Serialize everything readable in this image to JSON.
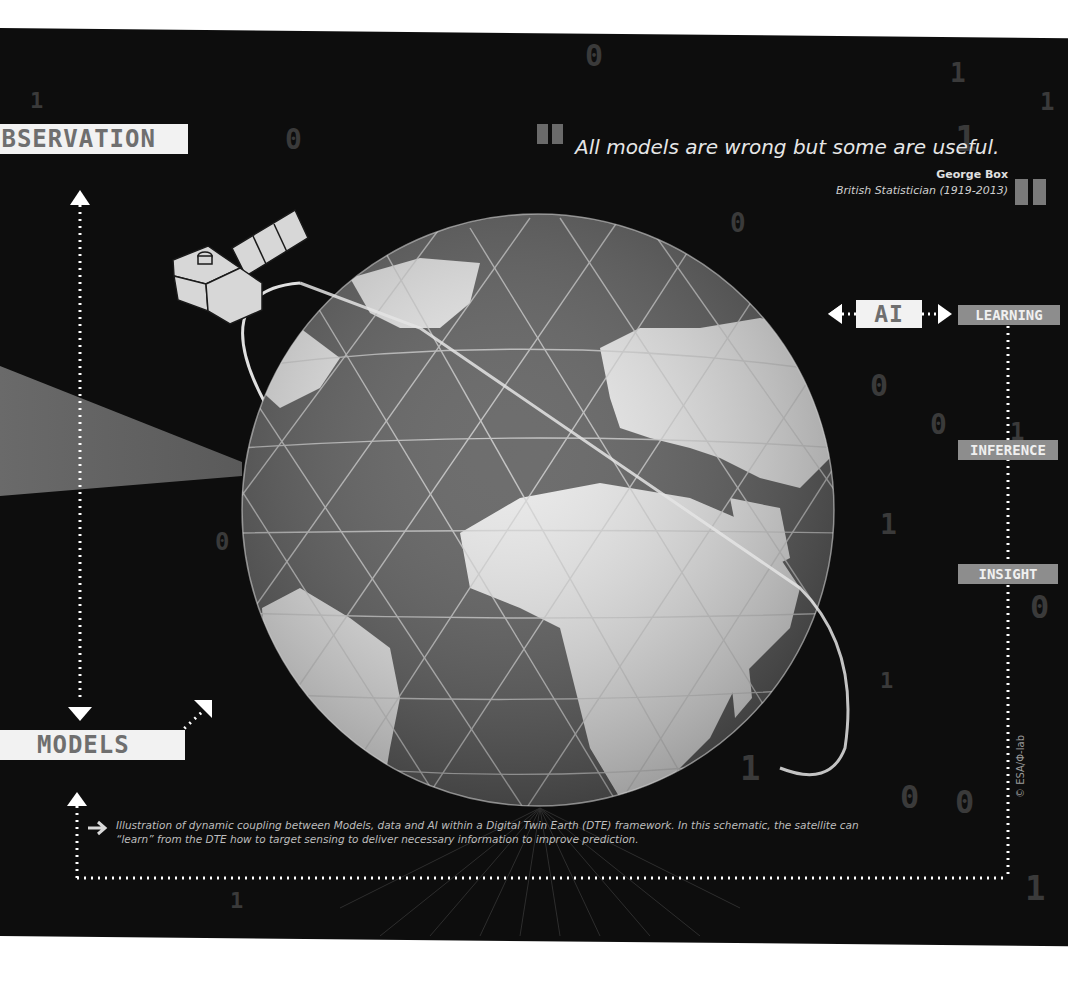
{
  "labels": {
    "observation": "OBSERVATION",
    "models": "MODELS",
    "ai": "AI",
    "learning": "LEARNING",
    "inference": "INFERENCE",
    "insight": "INSIGHT"
  },
  "quote": {
    "text": "All models are wrong but some are useful.",
    "author": "George Box",
    "author_description": "British Statistician (1919-2013)",
    "open_mark": "“",
    "close_mark": "”"
  },
  "caption": {
    "line1": "Illustration of dynamic coupling between Models, data and AI within a Digital Twin Earth (DTE) framework. In this schematic, the satellite can",
    "line2": "“learn” from the DTE how to target sensing to deliver necessary information to improve prediction."
  },
  "credit": "© ESA/Φ-lab",
  "colors": {
    "background": "#0d0d0d",
    "label_box": "#f2f2f2",
    "label_text": "#6f6f6f",
    "tag_box": "#8d8d8d",
    "ocean": "#5a5a5a",
    "land": "#e8e8e8"
  },
  "background_digits": [
    "0",
    "1",
    "0",
    "1",
    "0",
    "1",
    "1",
    "0",
    "0",
    "1",
    "0",
    "1",
    "0",
    "1",
    "0",
    "0",
    "1",
    "1",
    "0",
    "1"
  ]
}
